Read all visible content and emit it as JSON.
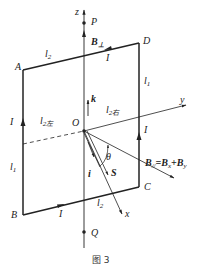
{
  "figure": {
    "caption": "图 3",
    "points": {
      "A": "A",
      "B": "B",
      "C": "C",
      "D": "D",
      "O": "O",
      "P": "P",
      "Q": "Q"
    },
    "axes": {
      "z": "z",
      "y": "y",
      "x": "x"
    },
    "labels": {
      "l2_top": "l",
      "l2_top_sub": "2",
      "l2_bottom": "l",
      "l2_bottom_sub": "2",
      "l1_left": "l",
      "l1_left_sub": "1",
      "l1_right": "l",
      "l1_right_sub": "1",
      "l2_left_half": "l",
      "l2_left_half_sub": "2左",
      "l2_right_half": "l",
      "l2_right_half_sub": "2右",
      "current_top": "I",
      "current_left": "I",
      "current_right": "I",
      "current_bottom": "I",
      "b_perp": "B",
      "b_perp_sub": "⊥",
      "k_vector": "k",
      "i_vector": "i",
      "s_vector": "S",
      "theta": "θ",
      "b_parallel": "B",
      "b_parallel_sub": "//",
      "b_parallel_eq": "=B",
      "b_x_sub": "x",
      "plus_b": "+B",
      "b_y_sub": "y"
    }
  }
}
